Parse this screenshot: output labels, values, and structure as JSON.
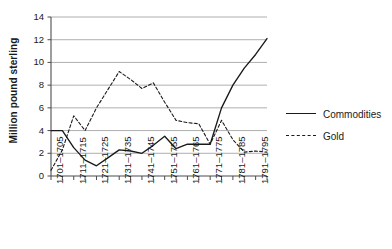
{
  "chart_data": {
    "type": "line",
    "title": "",
    "xlabel": "",
    "ylabel": "Million pound sterling",
    "ylim": [
      0,
      14
    ],
    "yticks": [
      0,
      2,
      4,
      6,
      8,
      10,
      12,
      14
    ],
    "ytick_labels": [
      "0",
      "2",
      "4",
      "6",
      "8",
      "10",
      "12",
      "14"
    ],
    "grid": true,
    "grid_axis": "y",
    "legend_position": "right",
    "categories": [
      "1701–1705",
      "1706–1710",
      "1711–1715",
      "1716–1720",
      "1721–1725",
      "1726–1730",
      "1731–1735",
      "1736–1740",
      "1741–1745",
      "1746–1750",
      "1751–1755",
      "1756–1760",
      "1761–1765",
      "1766–1770",
      "1771–1775",
      "1776–1780",
      "1781–1785",
      "1786–1790",
      "1791–1795",
      "1796–1800"
    ],
    "xtick_labels_visible": [
      "1701–1705",
      "1711–1715",
      "1721–1725",
      "1731–1735",
      "1741–1745",
      "1751–1755",
      "1761–1765",
      "1771–1775",
      "1781–1785",
      "1791–1795"
    ],
    "series": [
      {
        "name": "Commodities",
        "style": "solid",
        "color": "#1a1a1a",
        "values": [
          4.0,
          4.0,
          2.5,
          1.4,
          0.9,
          1.6,
          2.3,
          2.2,
          2.0,
          2.7,
          3.5,
          2.4,
          2.8,
          2.8,
          2.8,
          6.0,
          8.0,
          9.5,
          10.7,
          12.1
        ]
      },
      {
        "name": "Gold",
        "style": "dashed",
        "color": "#1a1a1a",
        "values": [
          0.5,
          2.3,
          5.3,
          4.0,
          6.0,
          7.6,
          9.2,
          8.5,
          7.7,
          8.2,
          6.5,
          4.9,
          4.7,
          4.6,
          2.8,
          4.9,
          3.2,
          2.1,
          2.2,
          2.1
        ]
      }
    ]
  },
  "legend": {
    "entries": [
      {
        "label": "Commodities",
        "style": "solid"
      },
      {
        "label": "Gold",
        "style": "dashed"
      }
    ]
  }
}
